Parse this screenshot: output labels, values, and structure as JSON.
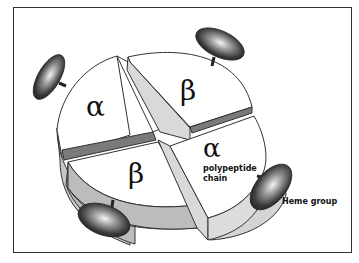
{
  "diagram": {
    "subunits": [
      {
        "id": "alpha-top-left",
        "symbol": "α"
      },
      {
        "id": "beta-top-right",
        "symbol": "β"
      },
      {
        "id": "beta-bottom-left",
        "symbol": "β"
      },
      {
        "id": "alpha-bottom-right",
        "symbol": "α"
      }
    ],
    "labels": {
      "polypeptide_line1": "polypeptide",
      "polypeptide_line2": "chain",
      "heme": "Heme group"
    },
    "heme_groups": 4,
    "colors": {
      "top_face": "#ffffff",
      "side_light": "#d9d9d9",
      "side_mid": "#bdbdbd",
      "groove_dark": "#7a7a7a",
      "heme_dark": "#2e2e2e",
      "heme_highlight": "#f2f2f2",
      "outline": "#333333"
    }
  }
}
